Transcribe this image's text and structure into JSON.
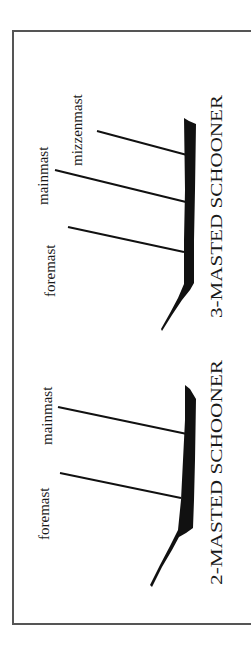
{
  "diagram": {
    "colors": {
      "ink": "#111111",
      "frame": "#555555",
      "background": "#ffffff"
    },
    "orientation": "rotated 90 degrees counter-clockwise",
    "ships": [
      {
        "title": "3-MASTED SCHOONER",
        "masts": [
          {
            "label": "foremast"
          },
          {
            "label": "mainmast"
          },
          {
            "label": "mizzenmast"
          }
        ]
      },
      {
        "title": "2-MASTED SCHOONER",
        "masts": [
          {
            "label": "foremast"
          },
          {
            "label": "mainmast"
          }
        ]
      }
    ]
  }
}
